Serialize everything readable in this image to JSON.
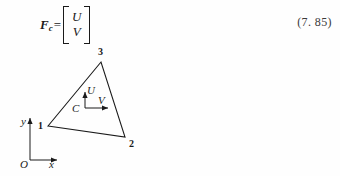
{
  "equation": {
    "lhs_symbol": "F",
    "lhs_subscript": "c",
    "equals": "=",
    "matrix_rows": [
      "U",
      "V"
    ],
    "number": "(7. 85)"
  },
  "figure": {
    "nodes": [
      {
        "id": "node-1",
        "label": "1"
      },
      {
        "id": "node-2",
        "label": "2"
      },
      {
        "id": "node-3",
        "label": "3"
      }
    ],
    "centroid_label": "C",
    "local_axes": [
      {
        "id": "local-axis-u",
        "label": "U"
      },
      {
        "id": "local-axis-v",
        "label": "V"
      }
    ],
    "global_axes": {
      "origin_label": "O",
      "x_label": "x",
      "y_label": "y"
    }
  },
  "colors": {
    "ink": "#1a1a1a",
    "page": "#fefefe"
  }
}
